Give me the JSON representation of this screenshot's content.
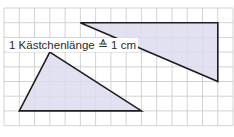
{
  "diagram": {
    "caption": "1 Kästchenlänge ≙ 1 cm",
    "grid": {
      "origin_x": 4,
      "origin_y": 8,
      "cell_w": 15.27,
      "cell_h": 14.7,
      "cols": 15,
      "rows": 8,
      "line_color": "#c8c8c8"
    },
    "colors": {
      "fill": "#dcdcee",
      "stroke": "#1e1e1e"
    },
    "triangles": [
      {
        "name": "right-triangle",
        "vertices_grid": [
          [
            5,
            1
          ],
          [
            14,
            1
          ],
          [
            14,
            5
          ]
        ]
      },
      {
        "name": "left-triangle",
        "vertices_grid": [
          [
            3,
            3
          ],
          [
            1,
            7
          ],
          [
            9,
            7
          ]
        ]
      }
    ]
  }
}
